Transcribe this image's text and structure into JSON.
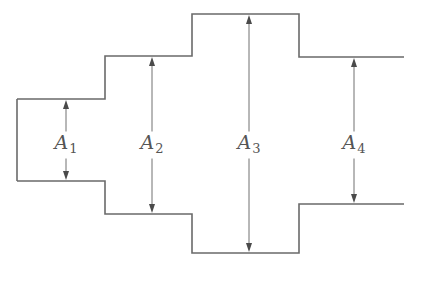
{
  "diagram": {
    "colors": {
      "outline": "#6a6a6a",
      "arrow": "#4a4a4a",
      "label": "#555555",
      "background": "#ffffff"
    },
    "sections": [
      {
        "id": "A1",
        "label_main": "A",
        "label_sub": "1",
        "x_start": 17,
        "x_end": 105,
        "top": 99,
        "bottom": 181,
        "arrow_x": 66
      },
      {
        "id": "A2",
        "label_main": "A",
        "label_sub": "2",
        "x_start": 105,
        "x_end": 192,
        "top": 56,
        "bottom": 214,
        "arrow_x": 152
      },
      {
        "id": "A3",
        "label_main": "A",
        "label_sub": "3",
        "x_start": 192,
        "x_end": 299,
        "top": 14,
        "bottom": 253,
        "arrow_x": 249
      },
      {
        "id": "A4",
        "label_main": "A",
        "label_sub": "4",
        "x_start": 299,
        "x_end": 404,
        "top": 57,
        "bottom": 204,
        "arrow_x": 354
      }
    ],
    "label_y": 145
  }
}
